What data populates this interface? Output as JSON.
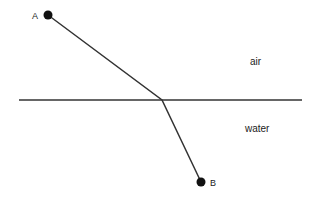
{
  "diagram": {
    "colors": {
      "line": "#333333",
      "point": "#111111",
      "text": "#222222",
      "background": "#ffffff"
    },
    "interface": {
      "x1": 19,
      "y1": 100,
      "x2": 302,
      "y2": 100
    },
    "bend_point": {
      "x": 162,
      "y": 100
    },
    "points": [
      {
        "id": "A",
        "label": "A",
        "x": 48,
        "y": 15,
        "label_x": 32,
        "label_y": 19
      },
      {
        "id": "B",
        "label": "B",
        "x": 201,
        "y": 182,
        "label_x": 210,
        "label_y": 186
      }
    ],
    "media": [
      {
        "label": "air",
        "x": 250,
        "y": 65
      },
      {
        "label": "water",
        "x": 245,
        "y": 132
      }
    ]
  }
}
